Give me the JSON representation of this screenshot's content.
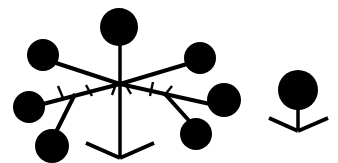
{
  "canvas": {
    "width": 338,
    "height": 163,
    "background_color": "#ffffff",
    "ink_color": "#000000",
    "title": "Symmetric branching node diagram with filled circular terminals"
  },
  "figures": [
    {
      "id": "main-figure",
      "name": "large-branching-figure",
      "description": "Large symmetric branching structure with seven filled circle terminals, a central vertical trunk and a V-shaped base",
      "trunk": {
        "name": "main-trunk",
        "x": 120,
        "y_top": 45,
        "y_bottom": 158,
        "stroke_width": 3.5
      },
      "hub": {
        "name": "central-hub",
        "x": 120,
        "y": 84
      },
      "base": {
        "name": "v-base",
        "left_x": 86,
        "left_y": 143,
        "vertex_x": 120,
        "vertex_y": 158,
        "right_x": 154,
        "right_y": 143,
        "stroke_width": 4
      },
      "circles": [
        {
          "name": "terminal-top-center",
          "cx": 119,
          "cy": 27,
          "r": 19
        },
        {
          "name": "terminal-upper-left",
          "cx": 43,
          "cy": 55,
          "r": 16
        },
        {
          "name": "terminal-mid-left",
          "cx": 29,
          "cy": 107,
          "r": 16
        },
        {
          "name": "terminal-lower-left",
          "cx": 52,
          "cy": 146,
          "r": 17
        },
        {
          "name": "terminal-upper-right",
          "cx": 200,
          "cy": 58,
          "r": 16
        },
        {
          "name": "terminal-mid-right",
          "cx": 224,
          "cy": 100,
          "r": 17
        },
        {
          "name": "terminal-lower-right",
          "cx": 196,
          "cy": 134,
          "r": 16
        }
      ],
      "branches": [
        {
          "name": "branch-hub-to-upper-left",
          "x1": 120,
          "y1": 84,
          "x2": 56,
          "y2": 63,
          "stroke_width": 4
        },
        {
          "name": "branch-hub-to-mid-left",
          "x1": 120,
          "y1": 84,
          "x2": 43,
          "y2": 104,
          "stroke_width": 4
        },
        {
          "name": "branch-fork-to-lower-left",
          "x1": 75,
          "y1": 94,
          "x2": 55,
          "y2": 134,
          "stroke_width": 4
        },
        {
          "name": "branch-hub-to-upper-right",
          "x1": 120,
          "y1": 84,
          "x2": 187,
          "y2": 64,
          "stroke_width": 4
        },
        {
          "name": "branch-hub-to-mid-right",
          "x1": 120,
          "y1": 84,
          "x2": 210,
          "y2": 104,
          "stroke_width": 4
        },
        {
          "name": "branch-fork-to-lower-right",
          "x1": 165,
          "y1": 94,
          "x2": 192,
          "y2": 124,
          "stroke_width": 4
        }
      ],
      "tick_marks": [
        {
          "name": "tick-left-outer",
          "x1": 63,
          "y1": 98,
          "x2": 58,
          "y2": 86
        },
        {
          "name": "tick-left-inner",
          "x1": 92,
          "y1": 96,
          "x2": 86,
          "y2": 85
        },
        {
          "name": "tick-hub-left",
          "x1": 112,
          "y1": 95,
          "x2": 116,
          "y2": 84
        },
        {
          "name": "tick-hub-right",
          "x1": 131,
          "y1": 94,
          "x2": 125,
          "y2": 84
        },
        {
          "name": "tick-right-inner",
          "x1": 150,
          "y1": 96,
          "x2": 153,
          "y2": 82
        },
        {
          "name": "tick-right-outer",
          "x1": 164,
          "y1": 96,
          "x2": 172,
          "y2": 86
        }
      ]
    },
    {
      "id": "small-figure",
      "name": "small-single-node-figure",
      "description": "Small standalone figure: one filled circle on a short stem above a V-shaped base",
      "trunk": {
        "name": "small-trunk",
        "x": 298,
        "y_top": 105,
        "y_bottom": 131,
        "stroke_width": 3.5
      },
      "base": {
        "name": "small-v-base",
        "left_x": 269,
        "left_y": 118,
        "vertex_x": 298,
        "vertex_y": 131,
        "right_x": 328,
        "right_y": 118,
        "stroke_width": 4
      },
      "circles": [
        {
          "name": "small-terminal-circle",
          "cx": 298,
          "cy": 90,
          "r": 20
        }
      ]
    }
  ]
}
